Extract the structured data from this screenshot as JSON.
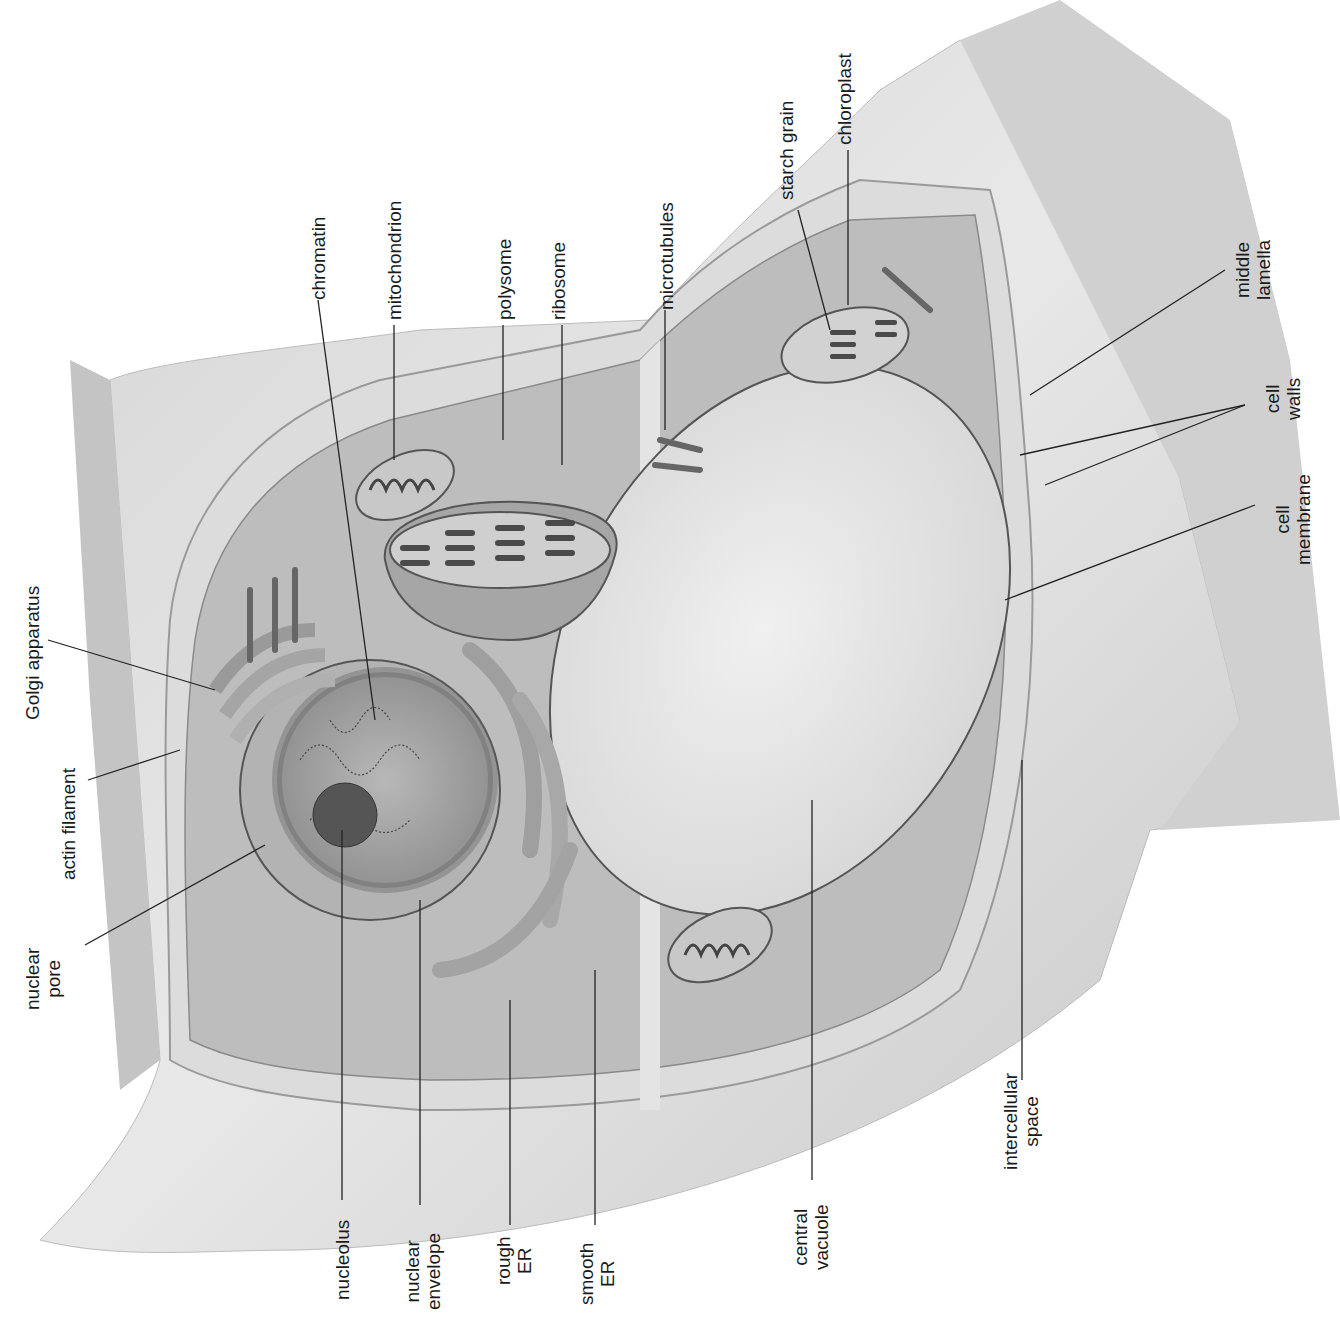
{
  "diagram": {
    "colors": {
      "background": "#ffffff",
      "wall_light": "#e6e6e6",
      "wall_mid": "#cfcfcf",
      "cytoplasm": "#bdbdbd",
      "vacuole": "#e9e9e9",
      "organelle": "#a9a9a9",
      "nucleus": "#9b9b9b",
      "leader_line": "#222222",
      "text": "#1a1a1a"
    },
    "labels": [
      {
        "id": "golgi",
        "text": "Golgi apparatus",
        "x": 22,
        "y": 720
      },
      {
        "id": "actin",
        "text": "actin filament",
        "x": 58,
        "y": 880
      },
      {
        "id": "nuclear_pore",
        "text": "nuclear\npore",
        "x": 22,
        "y": 1010
      },
      {
        "id": "chromatin",
        "text": "chromatin",
        "x": 308,
        "y": 300
      },
      {
        "id": "mitochondrion",
        "text": "mitochondrion",
        "x": 384,
        "y": 320
      },
      {
        "id": "polysome",
        "text": "polysome",
        "x": 494,
        "y": 320
      },
      {
        "id": "ribosome",
        "text": "ribosome",
        "x": 548,
        "y": 320
      },
      {
        "id": "microtubules",
        "text": "microtubules",
        "x": 656,
        "y": 310
      },
      {
        "id": "starch_grain",
        "text": "starch grain",
        "x": 776,
        "y": 200
      },
      {
        "id": "chloroplast",
        "text": "chloroplast",
        "x": 834,
        "y": 145
      },
      {
        "id": "middle_lamella",
        "text": "middle\nlamella",
        "x": 1232,
        "y": 300
      },
      {
        "id": "cell_walls",
        "text": "cell\nwalls",
        "x": 1262,
        "y": 420
      },
      {
        "id": "cell_membrane",
        "text": "cell\nmembrane",
        "x": 1272,
        "y": 565
      },
      {
        "id": "nucleolus",
        "text": "nucleolus",
        "x": 332,
        "y": 1300
      },
      {
        "id": "nuclear_envelope",
        "text": "nuclear\nenvelope",
        "x": 402,
        "y": 1310
      },
      {
        "id": "rough_er",
        "text": "rough\nER",
        "x": 493,
        "y": 1285
      },
      {
        "id": "smooth_er",
        "text": "smooth\nER",
        "x": 576,
        "y": 1305
      },
      {
        "id": "central_vacuole",
        "text": "central\nvacuole",
        "x": 790,
        "y": 1270
      },
      {
        "id": "intercellular_space",
        "text": "intercellular\nspace",
        "x": 1000,
        "y": 1170
      }
    ]
  }
}
